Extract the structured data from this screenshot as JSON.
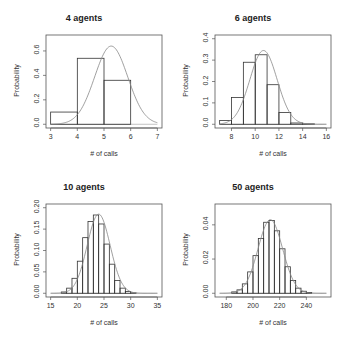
{
  "chart_data": [
    {
      "type": "bar",
      "title": "4 agents",
      "xlabel": "# of calls",
      "ylabel": "Probability",
      "xlim": [
        3,
        7
      ],
      "ylim": [
        0,
        0.7
      ],
      "xticks": [
        3,
        4,
        5,
        6,
        7
      ],
      "yticks": [
        "0.0",
        "0.2",
        "0.4",
        "0.6"
      ],
      "bins": [
        [
          3,
          4
        ],
        [
          4,
          5
        ],
        [
          5,
          6
        ]
      ],
      "values": [
        0.1,
        0.54,
        0.36
      ],
      "overlay": {
        "type": "normal_curve",
        "mean": 5.27,
        "peak": 0.64,
        "sd": 0.62
      }
    },
    {
      "type": "bar",
      "title": "6 agents",
      "xlabel": "# of calls",
      "ylabel": "Probability",
      "xlim": [
        7,
        16
      ],
      "ylim": [
        0,
        0.4
      ],
      "xticks": [
        8,
        10,
        12,
        14,
        16
      ],
      "yticks": [
        "0.0",
        "0.1",
        "0.2",
        "0.3",
        "0.4"
      ],
      "bins": [
        [
          7,
          8
        ],
        [
          8,
          9
        ],
        [
          9,
          10
        ],
        [
          10,
          11
        ],
        [
          11,
          12
        ],
        [
          12,
          13
        ],
        [
          13,
          14
        ],
        [
          14,
          15
        ]
      ],
      "values": [
        0.018,
        0.125,
        0.29,
        0.325,
        0.185,
        0.055,
        0.006,
        0.002
      ],
      "overlay": {
        "type": "normal_curve",
        "mean": 10.7,
        "peak": 0.345,
        "sd": 1.15
      }
    },
    {
      "type": "bar",
      "title": "10 agents",
      "xlabel": "# of calls",
      "ylabel": "Probability",
      "xlim": [
        15,
        35
      ],
      "ylim": [
        0,
        0.2
      ],
      "xticks": [
        15,
        20,
        25,
        30,
        35
      ],
      "yticks": [
        "0.00",
        "0.05",
        "0.10",
        "0.15",
        "0.20"
      ],
      "bins": [
        [
          17,
          18
        ],
        [
          18,
          19
        ],
        [
          19,
          20
        ],
        [
          20,
          21
        ],
        [
          21,
          22
        ],
        [
          22,
          23
        ],
        [
          23,
          24
        ],
        [
          24,
          25
        ],
        [
          25,
          26
        ],
        [
          26,
          27
        ],
        [
          27,
          28
        ],
        [
          28,
          29
        ],
        [
          29,
          30
        ],
        [
          30,
          31
        ]
      ],
      "values": [
        0.003,
        0.012,
        0.035,
        0.075,
        0.13,
        0.168,
        0.183,
        0.162,
        0.115,
        0.068,
        0.03,
        0.012,
        0.004,
        0.001
      ],
      "overlay": {
        "type": "normal_curve",
        "mean": 24.0,
        "peak": 0.185,
        "sd": 2.15
      }
    },
    {
      "type": "bar",
      "title": "50 agents",
      "xlabel": "# of calls",
      "ylabel": "Probability",
      "xlim": [
        175,
        255
      ],
      "ylim": [
        0,
        0.05
      ],
      "xticks": [
        180,
        200,
        220,
        240
      ],
      "yticks": [
        "0.00",
        "0.02",
        "0.04"
      ],
      "bins": [
        [
          184,
          188
        ],
        [
          188,
          192
        ],
        [
          192,
          196
        ],
        [
          196,
          200
        ],
        [
          200,
          204
        ],
        [
          204,
          208
        ],
        [
          208,
          212
        ],
        [
          212,
          216
        ],
        [
          216,
          220
        ],
        [
          220,
          224
        ],
        [
          224,
          228
        ],
        [
          228,
          232
        ],
        [
          232,
          236
        ],
        [
          236,
          240
        ],
        [
          240,
          244
        ]
      ],
      "values": [
        0.0008,
        0.002,
        0.0055,
        0.0125,
        0.022,
        0.032,
        0.0415,
        0.0425,
        0.0365,
        0.026,
        0.0155,
        0.0075,
        0.003,
        0.0012,
        0.0004
      ],
      "overlay": {
        "type": "normal_curve",
        "mean": 213,
        "peak": 0.043,
        "sd": 9.2
      }
    }
  ]
}
